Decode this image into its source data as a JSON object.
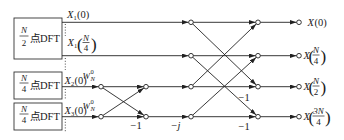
{
  "blocks": [
    {
      "numerator": "N",
      "denominator": "2",
      "label": "点DFT"
    },
    {
      "numerator": "N",
      "denominator": "4",
      "label": "点DFT"
    },
    {
      "numerator": "N",
      "denominator": "4",
      "label": "点DFT"
    }
  ],
  "inputs": {
    "x1_0": {
      "symbol": "X",
      "sub": "1",
      "arg": "(0)"
    },
    "x1_n4": {
      "symbol": "X",
      "sub": "1",
      "lparen": "(",
      "num": "N",
      "den": "4",
      "rparen": ")"
    },
    "x2_0": {
      "symbol": "X",
      "sub": "2",
      "arg": "(0)",
      "twiddle": {
        "base": "W",
        "sub": "N",
        "sup": "0"
      }
    },
    "x3_0": {
      "symbol": "X",
      "sub": "3",
      "arg": "(0)",
      "twiddle": {
        "base": "W",
        "sub": "N",
        "sup": "0"
      }
    }
  },
  "branch_gains": {
    "stage2_row3": "−1",
    "stage3_row3": "−j",
    "stage4_row2": "−1",
    "stage4_row3": "−1"
  },
  "outputs": [
    {
      "symbol": "X",
      "arg": "(0)"
    },
    {
      "symbol": "X",
      "lparen": "(",
      "num": "N",
      "den": "4",
      "rparen": ")"
    },
    {
      "symbol": "X",
      "lparen": "(",
      "num": "N",
      "den": "2",
      "rparen": ")"
    },
    {
      "symbol": "X",
      "lparen": "(",
      "num": "3N",
      "den": "4",
      "rparen": ")"
    }
  ],
  "colors": {
    "stroke": "#222222",
    "background": "#ffffff",
    "node_fill": "#ffffff"
  }
}
